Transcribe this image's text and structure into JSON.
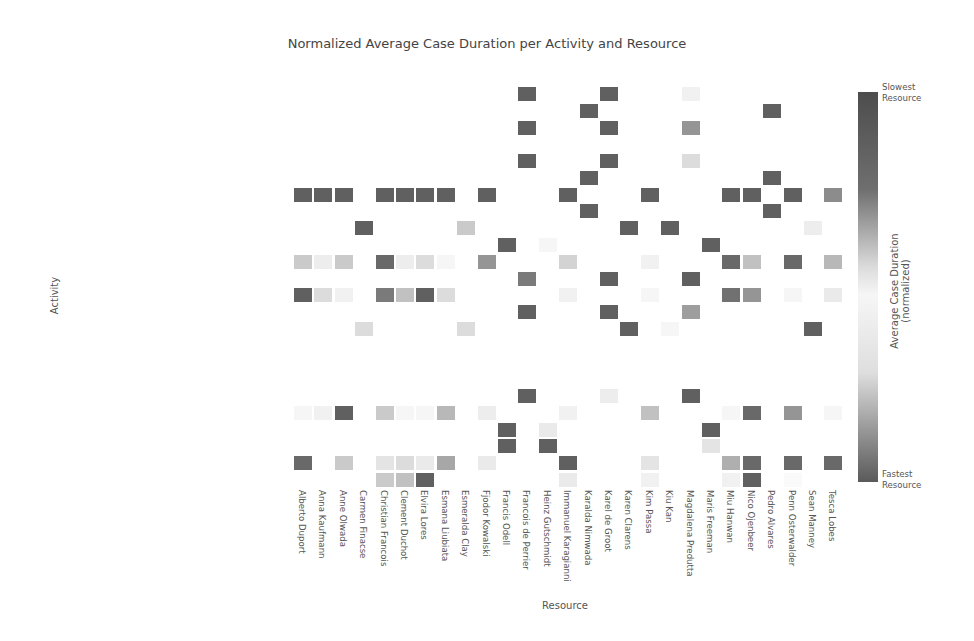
{
  "chart_data": {
    "type": "heatmap",
    "title": "Normalized Average Case Duration per Activity and Resource",
    "xlabel": "Resource",
    "ylabel": "Activity",
    "colorbar": {
      "label": "Average Case Duration (normalized)",
      "top_label": "Slowest\nResource",
      "bottom_label": "Fastest\nResource",
      "top_line1": "Slowest",
      "top_line2": "Resource",
      "bottom_line1": "Fastest",
      "bottom_line2": "Resource"
    },
    "rows": [
      "Settle dispute with supplier Purchasing Agent",
      "Settle dispute with supplier Financial Manager",
      "Settle conditions with supplier",
      "Send invoice",
      "Send Request for Quotation to Supplier",
      "Release Supplier's Invoice",
      "Release Purchase Order",
      "Pay invoice",
      "Deliver Goods Services",
      "Create Request for Quotation Requester Manager",
      "Create Request for Quotation Requester",
      "Create Quotation comparison Map",
      "Create Purchase Requisition",
      "Create Purchase Order",
      "Confirm Purchase Order",
      "Choose best option",
      "Authorize Supplier's Invoice payment",
      "Approve Purchase Order for payment",
      "Analyze Request for Quotation",
      "Analyze Quotation comparison Map",
      "Analyze Purchase Requisition",
      "Amend Request for Quotation Requester Manager",
      "Amend Request for Quotation Requester",
      "Amend Purchase Requisition"
    ],
    "columns": [
      "Alberto Duport",
      "Anna Kaufmann",
      "Anne Olwada",
      "Carmen Finacse",
      "Christian Francois",
      "Clement Duchot",
      "Elvira Lores",
      "Esmana Liubiata",
      "Esmeralda Clay",
      "Fjodor Kowalski",
      "Francis Odell",
      "Francois de Perrier",
      "Heinz Gutschmidt",
      "Immanuel Karagianni",
      "Karalda Nimwada",
      "Karel de Groot",
      "Karen Clarens",
      "Kim Passa",
      "Kiu Kan",
      "Magdalena Predutta",
      "Maris Freeman",
      "Miu Hanwan",
      "Nico Ojenbeer",
      "Pedro Alvares",
      "Penn Osterwalder",
      "Sean Manney",
      "Tesca Lobes"
    ],
    "cells_note": "value: 1 = slowest (dark), 0.5 = median (white), 0 = fastest (dark); intensity shown as darkness d in [0,1]",
    "cells": [
      [
        0,
        11,
        0.9
      ],
      [
        0,
        15,
        0.9
      ],
      [
        0,
        19,
        0.08
      ],
      [
        1,
        14,
        0.9
      ],
      [
        1,
        23,
        0.9
      ],
      [
        2,
        11,
        0.9
      ],
      [
        2,
        15,
        0.9
      ],
      [
        2,
        19,
        0.6
      ],
      [
        4,
        11,
        0.9
      ],
      [
        4,
        15,
        0.9
      ],
      [
        4,
        19,
        0.2
      ],
      [
        5,
        14,
        0.9
      ],
      [
        5,
        23,
        0.9
      ],
      [
        6,
        0,
        0.9
      ],
      [
        6,
        1,
        0.9
      ],
      [
        6,
        2,
        0.9
      ],
      [
        6,
        4,
        0.9
      ],
      [
        6,
        5,
        0.9
      ],
      [
        6,
        6,
        0.9
      ],
      [
        6,
        7,
        0.9
      ],
      [
        6,
        9,
        0.9
      ],
      [
        6,
        13,
        0.9
      ],
      [
        6,
        17,
        0.9
      ],
      [
        6,
        21,
        0.9
      ],
      [
        6,
        22,
        0.9
      ],
      [
        6,
        24,
        0.9
      ],
      [
        6,
        26,
        0.65
      ],
      [
        7,
        14,
        0.9
      ],
      [
        7,
        23,
        0.9
      ],
      [
        8,
        3,
        0.9
      ],
      [
        8,
        8,
        0.3
      ],
      [
        8,
        16,
        0.9
      ],
      [
        8,
        18,
        0.9
      ],
      [
        8,
        25,
        0.1
      ],
      [
        9,
        10,
        0.9
      ],
      [
        9,
        12,
        0.05
      ],
      [
        9,
        20,
        0.9
      ],
      [
        10,
        0,
        0.3
      ],
      [
        10,
        1,
        0.1
      ],
      [
        10,
        2,
        0.3
      ],
      [
        10,
        4,
        0.85
      ],
      [
        10,
        5,
        0.1
      ],
      [
        10,
        6,
        0.2
      ],
      [
        10,
        7,
        0.05
      ],
      [
        10,
        9,
        0.6
      ],
      [
        10,
        13,
        0.25
      ],
      [
        10,
        17,
        0.08
      ],
      [
        10,
        21,
        0.85
      ],
      [
        10,
        22,
        0.35
      ],
      [
        10,
        24,
        0.85
      ],
      [
        10,
        26,
        0.4
      ],
      [
        11,
        11,
        0.75
      ],
      [
        11,
        15,
        0.9
      ],
      [
        11,
        19,
        0.9
      ],
      [
        12,
        0,
        0.9
      ],
      [
        12,
        1,
        0.2
      ],
      [
        12,
        2,
        0.08
      ],
      [
        12,
        4,
        0.75
      ],
      [
        12,
        5,
        0.35
      ],
      [
        12,
        6,
        0.9
      ],
      [
        12,
        7,
        0.2
      ],
      [
        12,
        13,
        0.08
      ],
      [
        12,
        17,
        0.05
      ],
      [
        12,
        21,
        0.8
      ],
      [
        12,
        22,
        0.6
      ],
      [
        12,
        24,
        0.05
      ],
      [
        12,
        26,
        0.12
      ],
      [
        13,
        11,
        0.9
      ],
      [
        13,
        15,
        0.9
      ],
      [
        13,
        19,
        0.55
      ],
      [
        14,
        3,
        0.2
      ],
      [
        14,
        8,
        0.2
      ],
      [
        14,
        16,
        0.9
      ],
      [
        14,
        18,
        0.05
      ],
      [
        14,
        25,
        0.9
      ],
      [
        18,
        11,
        0.9
      ],
      [
        18,
        15,
        0.1
      ],
      [
        18,
        19,
        0.9
      ],
      [
        19,
        0,
        0.05
      ],
      [
        19,
        1,
        0.08
      ],
      [
        19,
        2,
        0.9
      ],
      [
        19,
        4,
        0.3
      ],
      [
        19,
        5,
        0.05
      ],
      [
        19,
        6,
        0.05
      ],
      [
        19,
        7,
        0.4
      ],
      [
        19,
        9,
        0.1
      ],
      [
        19,
        13,
        0.08
      ],
      [
        19,
        17,
        0.35
      ],
      [
        19,
        21,
        0.05
      ],
      [
        19,
        22,
        0.85
      ],
      [
        19,
        24,
        0.6
      ],
      [
        19,
        26,
        0.05
      ],
      [
        20,
        10,
        0.9
      ],
      [
        20,
        12,
        0.12
      ],
      [
        20,
        20,
        0.9
      ],
      [
        21,
        10,
        0.9
      ],
      [
        21,
        12,
        0.9
      ],
      [
        21,
        20,
        0.15
      ],
      [
        22,
        0,
        0.85
      ],
      [
        22,
        2,
        0.3
      ],
      [
        22,
        4,
        0.15
      ],
      [
        22,
        5,
        0.2
      ],
      [
        22,
        6,
        0.12
      ],
      [
        22,
        7,
        0.5
      ],
      [
        22,
        9,
        0.12
      ],
      [
        22,
        13,
        0.9
      ],
      [
        22,
        17,
        0.15
      ],
      [
        22,
        21,
        0.45
      ],
      [
        22,
        22,
        0.85
      ],
      [
        22,
        24,
        0.85
      ],
      [
        22,
        26,
        0.85
      ],
      [
        23,
        4,
        0.3
      ],
      [
        23,
        5,
        0.35
      ],
      [
        23,
        6,
        0.9
      ],
      [
        23,
        13,
        0.12
      ],
      [
        23,
        17,
        0.08
      ],
      [
        23,
        21,
        0.08
      ],
      [
        23,
        22,
        0.9
      ],
      [
        23,
        24,
        0.03
      ]
    ]
  }
}
